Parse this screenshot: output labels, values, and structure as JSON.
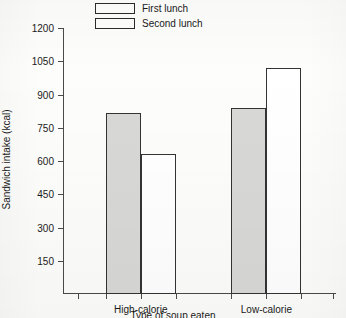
{
  "chart_data": {
    "type": "bar",
    "title": "",
    "xlabel": "Type of soup eaten",
    "ylabel": "Sandwich intake (kcal)",
    "categories": [
      "High-calorie",
      "Low-calorie"
    ],
    "series": [
      {
        "name": "First lunch",
        "values": [
          815,
          840
        ],
        "fill": "#d8d8d6"
      },
      {
        "name": "Second lunch",
        "values": [
          630,
          1020
        ],
        "fill": "#ffffff"
      }
    ],
    "ylim": [
      0,
      1200
    ],
    "yticks": [
      150,
      300,
      450,
      600,
      750,
      900,
      1050,
      1200
    ],
    "ytick_labels": [
      "150",
      "300",
      "450",
      "600",
      "750",
      "900",
      "1050",
      "1200"
    ],
    "grid": false,
    "legend_position": "top-center",
    "axis_color": "#4a4a4a",
    "bar_edge_color": "#333333"
  }
}
